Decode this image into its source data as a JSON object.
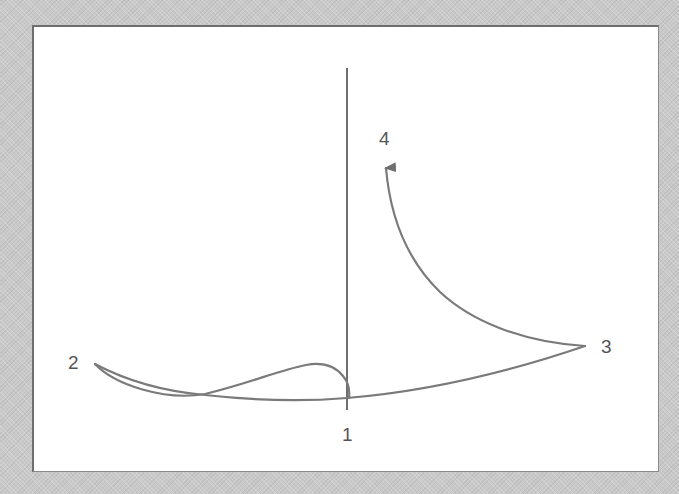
{
  "diagram": {
    "type": "trajectory-path",
    "stroke_color": "#7a7a7a",
    "background_color": "#ffffff",
    "vertical_axis": {
      "x": 347,
      "y_top": 68,
      "y_bottom": 410
    },
    "points": [
      {
        "id": "1",
        "label": "1",
        "x": 347,
        "y": 398,
        "label_x": 342,
        "label_y": 425
      },
      {
        "id": "2",
        "label": "2",
        "x": 95,
        "y": 364,
        "label_x": 68,
        "label_y": 353
      },
      {
        "id": "3",
        "label": "3",
        "x": 585,
        "y": 346,
        "label_x": 601,
        "label_y": 337
      },
      {
        "id": "4",
        "label": "4",
        "x": 386,
        "y": 163,
        "label_x": 379,
        "label_y": 129
      }
    ],
    "segments": [
      {
        "from": "1",
        "to": "2",
        "description": "loop up from 1 over a hump then down-left to 2"
      },
      {
        "from": "2",
        "to": "3",
        "description": "lower arc from 2 through bottom near 1 rising to 3"
      },
      {
        "from": "3",
        "to": "4",
        "description": "upward sweep ending in arrowhead at 4"
      }
    ]
  }
}
